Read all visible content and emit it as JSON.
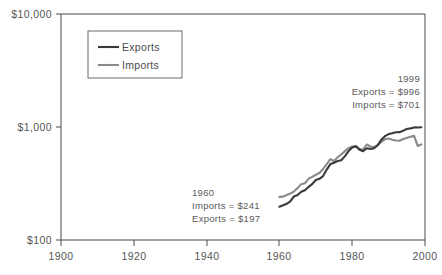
{
  "chart_data": {
    "type": "line",
    "title": "",
    "xlabel": "",
    "ylabel": "",
    "yscale": "log",
    "ylim": [
      100,
      10000
    ],
    "xlim": [
      1900,
      2000
    ],
    "grid": false,
    "legend_position": "top-left-inside",
    "y_ticks": [
      {
        "value": 100,
        "label": "$100"
      },
      {
        "value": 1000,
        "label": "$1,000"
      },
      {
        "value": 10000,
        "label": "$10,000"
      }
    ],
    "x_ticks": [
      {
        "value": 1900,
        "label": "1900"
      },
      {
        "value": 1920,
        "label": "1920"
      },
      {
        "value": 1940,
        "label": "1940"
      },
      {
        "value": 1960,
        "label": "1960"
      },
      {
        "value": 1980,
        "label": "1980"
      },
      {
        "value": 2000,
        "label": "2000"
      }
    ],
    "x": [
      1960,
      1961,
      1962,
      1963,
      1964,
      1965,
      1966,
      1967,
      1968,
      1969,
      1970,
      1971,
      1972,
      1973,
      1974,
      1975,
      1976,
      1977,
      1978,
      1979,
      1980,
      1981,
      1982,
      1983,
      1984,
      1985,
      1986,
      1987,
      1988,
      1989,
      1990,
      1991,
      1992,
      1993,
      1994,
      1995,
      1996,
      1997,
      1998,
      1999
    ],
    "series": [
      {
        "name": "Exports",
        "color": "#3a3a3a",
        "width": 2.1,
        "values": [
          197,
          203,
          209,
          220,
          243,
          250,
          267,
          276,
          295,
          312,
          340,
          348,
          368,
          420,
          470,
          482,
          500,
          508,
          552,
          612,
          658,
          672,
          630,
          610,
          648,
          638,
          648,
          690,
          772,
          830,
          866,
          880,
          898,
          900,
          928,
          960,
          972,
          992,
          990,
          996
        ]
      },
      {
        "name": "Imports",
        "color": "#8a8a8a",
        "width": 2.1,
        "values": [
          241,
          242,
          250,
          258,
          268,
          288,
          312,
          318,
          348,
          362,
          378,
          392,
          425,
          470,
          520,
          500,
          540,
          572,
          612,
          650,
          672,
          682,
          640,
          630,
          700,
          672,
          662,
          690,
          740,
          778,
          790,
          772,
          760,
          755,
          782,
          800,
          818,
          835,
          680,
          701
        ]
      }
    ],
    "legend": [
      {
        "label": "Exports",
        "color": "#3a3a3a"
      },
      {
        "label": "Imports",
        "color": "#8a8a8a"
      }
    ],
    "annotations": [
      {
        "id": "anno-1999",
        "align": "right",
        "lines": [
          "1999",
          "Exports = $996",
          "Imports = $701"
        ]
      },
      {
        "id": "anno-1960",
        "align": "left",
        "lines": [
          "1960",
          "Imports = $241",
          "Exports = $197"
        ]
      }
    ]
  }
}
